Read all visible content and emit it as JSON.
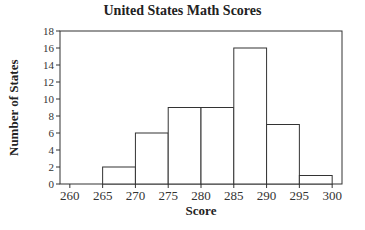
{
  "chart_data": {
    "type": "bar",
    "subtype": "histogram",
    "title": "United States Math Scores",
    "xlabel": "Score",
    "ylabel": "Number of States",
    "bins": [
      {
        "start": 265,
        "end": 270,
        "count": 2
      },
      {
        "start": 270,
        "end": 275,
        "count": 6
      },
      {
        "start": 275,
        "end": 280,
        "count": 9
      },
      {
        "start": 280,
        "end": 285,
        "count": 9
      },
      {
        "start": 285,
        "end": 290,
        "count": 16
      },
      {
        "start": 290,
        "end": 295,
        "count": 7
      },
      {
        "start": 295,
        "end": 300,
        "count": 1
      }
    ],
    "categories": [
      "265-270",
      "270-275",
      "275-280",
      "280-285",
      "285-290",
      "290-295",
      "295-300"
    ],
    "values": [
      2,
      6,
      9,
      9,
      16,
      7,
      1
    ],
    "xticks": [
      260,
      265,
      270,
      275,
      280,
      285,
      290,
      295,
      300
    ],
    "yticks": [
      0,
      2,
      4,
      6,
      8,
      10,
      12,
      14,
      16,
      18
    ],
    "xlim": [
      258.5,
      301.5
    ],
    "ylim": [
      0,
      18
    ],
    "grid": false,
    "legend": null,
    "colors": {
      "bar_fill": "#ffffff",
      "bar_edge": "#333333",
      "axis": "#333333"
    }
  }
}
